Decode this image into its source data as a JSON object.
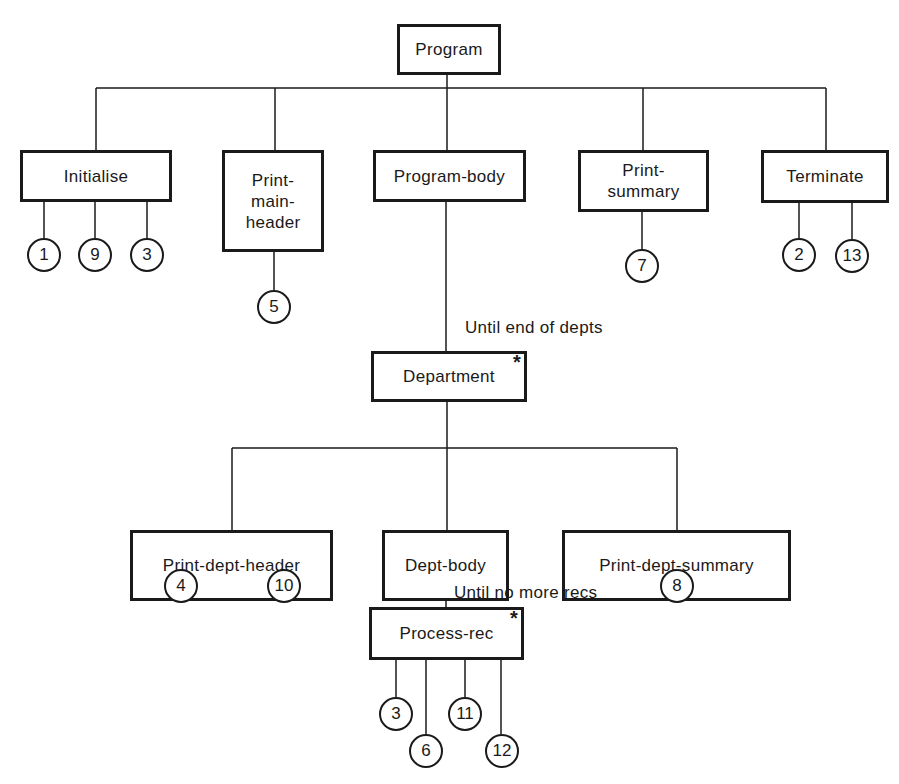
{
  "diagram": {
    "type": "Jackson structure chart",
    "nodes": {
      "program": {
        "label": "Program"
      },
      "initialise": {
        "label": "Initialise",
        "operations": [
          "1",
          "9",
          "3"
        ]
      },
      "print_main_header": {
        "label": "Print-\nmain-\nheader",
        "line1": "Print-",
        "line2": "main-",
        "line3": "header",
        "operations": [
          "5"
        ]
      },
      "program_body": {
        "label": "Program-body"
      },
      "print_summary": {
        "label": "Print-\nsummary",
        "line1": "Print-",
        "line2": "summary",
        "operations": [
          "7"
        ]
      },
      "terminate": {
        "label": "Terminate",
        "operations": [
          "2",
          "13"
        ]
      },
      "department": {
        "label": "Department",
        "iteration_marker": "*",
        "condition": "Until end of depts"
      },
      "print_dept_header": {
        "label": "Print-dept-header",
        "operations": [
          "4",
          "10"
        ]
      },
      "dept_body": {
        "label": "Dept-body"
      },
      "print_dept_summary": {
        "label": "Print-dept-summary",
        "operations": [
          "8"
        ]
      },
      "process_rec": {
        "label": "Process-rec",
        "iteration_marker": "*",
        "condition": "Until no more recs",
        "operations": [
          "3",
          "6",
          "11",
          "12"
        ]
      }
    },
    "edges": [
      [
        "Program",
        "Initialise"
      ],
      [
        "Program",
        "Print-main-header"
      ],
      [
        "Program",
        "Program-body"
      ],
      [
        "Program",
        "Print-summary"
      ],
      [
        "Program",
        "Terminate"
      ],
      [
        "Program-body",
        "Department"
      ],
      [
        "Department",
        "Print-dept-header"
      ],
      [
        "Department",
        "Dept-body"
      ],
      [
        "Department",
        "Print-dept-summary"
      ],
      [
        "Dept-body",
        "Process-rec"
      ]
    ]
  }
}
